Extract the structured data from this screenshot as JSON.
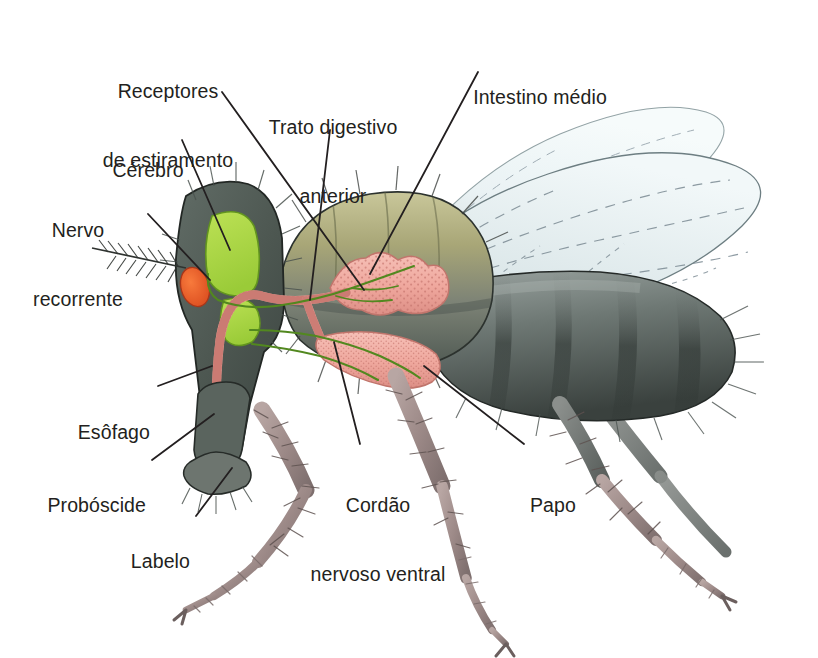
{
  "figure": {
    "language": "pt-BR",
    "background_color": "#ffffff",
    "leader_line_color": "#231f20",
    "label_text_color": "#231f20"
  },
  "labels": [
    {
      "id": "receptores-de-estiramento",
      "line1": "Receptores",
      "line2": "de estiramento",
      "align": "center",
      "x": 152,
      "y": 38,
      "points_to": "stretch-receptors-thorax"
    },
    {
      "id": "cerebro",
      "line1": "Cérebro",
      "line2": "",
      "align": "center",
      "x": 105,
      "y": 117,
      "points_to": "brain-green-lobe"
    },
    {
      "id": "nervo-recorrente",
      "line1": "Nervo",
      "line2": "recorrente",
      "align": "center",
      "x": 40,
      "y": 177,
      "points_to": "recurrent-nerve"
    },
    {
      "id": "trato-digestivo-anterior",
      "line1": "Trato digestivo",
      "line2": "anterior",
      "align": "center",
      "x": 253,
      "y": 74,
      "points_to": "foregut"
    },
    {
      "id": "intestino-medio",
      "line1": "Intestino médio",
      "line2": "",
      "align": "center",
      "x": 456,
      "y": 44,
      "points_to": "midgut"
    },
    {
      "id": "esofago",
      "line1": "Esôfago",
      "line2": "",
      "align": "right",
      "x": 72,
      "y": 379,
      "points_to": "esophagus"
    },
    {
      "id": "proboscide",
      "line1": "Probóscide",
      "line2": "",
      "align": "right",
      "x": 35,
      "y": 452,
      "points_to": "proboscis"
    },
    {
      "id": "labelo",
      "line1": "Labelo",
      "line2": "",
      "align": "right",
      "x": 130,
      "y": 508,
      "points_to": "labellum"
    },
    {
      "id": "cordao-nervoso-ventral",
      "line1": "Cordão",
      "line2": "nervoso ventral",
      "align": "center",
      "x": 300,
      "y": 452,
      "points_to": "ventral-nerve-cord"
    },
    {
      "id": "papo",
      "line1": "Papo",
      "line2": "",
      "align": "left",
      "x": 508,
      "y": 452,
      "points_to": "crop"
    }
  ],
  "anatomy": {
    "parts": [
      {
        "id": "brain-green-lobe",
        "name": "Cérebro",
        "color": "#a6d93f"
      },
      {
        "id": "subesophageal-ganglion",
        "name": "Gânglio subesofágico",
        "color": "#a6d93f"
      },
      {
        "id": "recurrent-nerve",
        "name": "Nervo recorrente",
        "color": "#4b7a1e"
      },
      {
        "id": "ventral-nerve-cord",
        "name": "Cordão nervoso ventral",
        "color": "#4b7a1e"
      },
      {
        "id": "esophagus",
        "name": "Esôfago",
        "color": "#eda79e"
      },
      {
        "id": "foregut",
        "name": "Trato digestivo anterior",
        "color": "#eda79e"
      },
      {
        "id": "midgut",
        "name": "Intestino médio",
        "color": "#f0a79d"
      },
      {
        "id": "crop",
        "name": "Papo",
        "color": "#f0a79d"
      },
      {
        "id": "eye",
        "name": "Olho",
        "color": "#e8572a"
      },
      {
        "id": "head-capsule",
        "name": "Cápsula cefálica",
        "color": "#545e58"
      },
      {
        "id": "thorax",
        "name": "Tórax",
        "color": "#9d9c6d"
      },
      {
        "id": "abdomen",
        "name": "Abdome",
        "color": "#5d6662"
      },
      {
        "id": "wing",
        "name": "Asa",
        "color": "#e4eef0"
      },
      {
        "id": "leg",
        "name": "Perna",
        "color": "#a38e8c"
      },
      {
        "id": "proboscis",
        "name": "Probóscide",
        "color": "#5c6660"
      },
      {
        "id": "labellum",
        "name": "Labelo",
        "color": "#6a726c"
      },
      {
        "id": "stretch-receptors-thorax",
        "name": "Receptores de estiramento",
        "color": "#4b7a1e"
      },
      {
        "id": "arista",
        "name": "Arista",
        "color": "#3a3a38"
      }
    ]
  }
}
